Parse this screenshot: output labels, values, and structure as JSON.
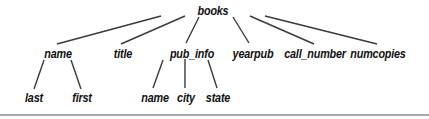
{
  "tree": {
    "root": {
      "label": "books",
      "x": 213,
      "y": 4
    },
    "level1": [
      {
        "label": "name",
        "x": 58,
        "y": 47
      },
      {
        "label": "title",
        "x": 123,
        "y": 47
      },
      {
        "label": "pub_info",
        "x": 192,
        "y": 47
      },
      {
        "label": "yearpub",
        "x": 253,
        "y": 47
      },
      {
        "label": "call_number",
        "x": 315,
        "y": 47
      },
      {
        "label": "numcopies",
        "x": 378,
        "y": 47
      }
    ],
    "level2": [
      {
        "label": "last",
        "x": 34,
        "y": 91
      },
      {
        "label": "first",
        "x": 82,
        "y": 91
      },
      {
        "label": "name",
        "x": 155,
        "y": 91
      },
      {
        "label": "city",
        "x": 186,
        "y": 91
      },
      {
        "label": "state",
        "x": 218,
        "y": 91
      }
    ],
    "edges": [
      {
        "from": "books",
        "to": "name",
        "x1": 161,
        "y1": 16,
        "x2": 57,
        "y2": 44
      },
      {
        "from": "books",
        "to": "title",
        "x1": 185,
        "y1": 16,
        "x2": 121,
        "y2": 44
      },
      {
        "from": "books",
        "to": "pub_info",
        "x1": 199,
        "y1": 17,
        "x2": 186,
        "y2": 43
      },
      {
        "from": "books",
        "to": "yearpub",
        "x1": 233,
        "y1": 17,
        "x2": 249,
        "y2": 43
      },
      {
        "from": "books",
        "to": "call_number",
        "x1": 250,
        "y1": 16,
        "x2": 314,
        "y2": 44
      },
      {
        "from": "books",
        "to": "numcopies",
        "x1": 265,
        "y1": 16,
        "x2": 377,
        "y2": 44
      },
      {
        "from": "name",
        "to": "last",
        "x1": 44,
        "y1": 60,
        "x2": 34,
        "y2": 89
      },
      {
        "from": "name",
        "to": "first",
        "x1": 71,
        "y1": 60,
        "x2": 81,
        "y2": 89
      },
      {
        "from": "pub_info",
        "to": "name",
        "x1": 163,
        "y1": 60,
        "x2": 153,
        "y2": 88
      },
      {
        "from": "pub_info",
        "to": "city",
        "x1": 185,
        "y1": 59,
        "x2": 185,
        "y2": 88
      },
      {
        "from": "pub_info",
        "to": "state",
        "x1": 208,
        "y1": 60,
        "x2": 217,
        "y2": 88
      }
    ],
    "line_color": "#3a3a3a",
    "rule_color": "#a8a8a8"
  }
}
